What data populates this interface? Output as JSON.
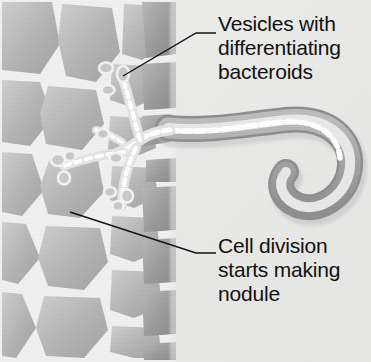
{
  "figure": {
    "background_color": "#ededec",
    "cell_fill": "#b5b5b5",
    "cell_fill_dark": "#9a9a9a",
    "cell_wall_color": "#f2f2f2",
    "hair_wall_color": "#a8a8a8",
    "hair_lumen_color": "#efefef",
    "bacteroid_color": "#ffffff",
    "leader_color": "#111111",
    "text_color": "#111111"
  },
  "labels": {
    "vesicles": {
      "line1": "Vesicles with",
      "line2": "differentiating",
      "line3": "bacteroids"
    },
    "nodule": {
      "line1": "Cell division",
      "line2": "starts making",
      "line3": "nodule"
    }
  },
  "parts": {
    "root_hair": "root-hair",
    "infection_thread": "infection-thread",
    "cortex_cells": "cortex-cells",
    "epidermis_layer": "epidermis-layer",
    "vesicles": "vesicles",
    "shepherds_crook": "shepherds-crook"
  }
}
